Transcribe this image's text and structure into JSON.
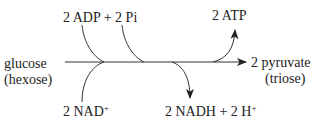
{
  "diagram": {
    "type": "reaction-pathway",
    "colors": {
      "line": "#333333",
      "text": "#222222",
      "background": "#ffffff"
    },
    "inputs": {
      "main_substrate": {
        "name": "glucose",
        "note": "(hexose)"
      },
      "adp_pi": "2 ADP + 2 Pi",
      "nad": {
        "text": "2 NAD",
        "sup": "+"
      }
    },
    "outputs": {
      "main_product": {
        "name": "2 pyruvate",
        "note": "(triose)"
      },
      "atp": "2 ATP",
      "nadh": {
        "text": "2 NADH + 2 H",
        "sup": "+"
      }
    },
    "edges": [
      {
        "from": "glucose",
        "to": "2 pyruvate",
        "kind": "main-arrow"
      },
      {
        "from": "2 ADP + 2 Pi",
        "to": "main-arrow",
        "kind": "curved-input"
      },
      {
        "from": "2 NAD+",
        "to": "main-arrow",
        "kind": "curved-input"
      },
      {
        "from": "main-arrow",
        "to": "2 ATP",
        "kind": "curved-output"
      },
      {
        "from": "main-arrow",
        "to": "2 NADH + 2 H+",
        "kind": "curved-output"
      }
    ]
  }
}
